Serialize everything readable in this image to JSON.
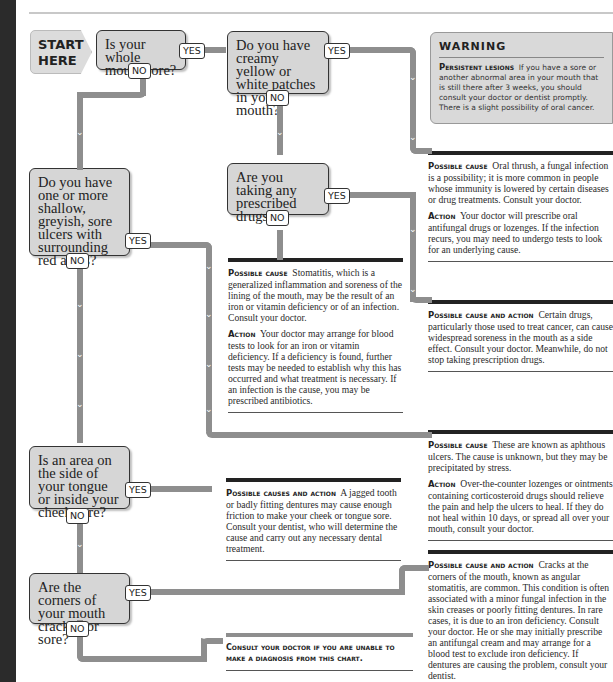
{
  "start": {
    "line1": "START",
    "line2": "HERE"
  },
  "labels": {
    "yes": "YES",
    "no": "NO"
  },
  "questions": [
    {
      "id": "q1",
      "text": "Is your whole mouth sore?"
    },
    {
      "id": "q2",
      "text": "Do you have creamy yellow or white patches in your mouth?"
    },
    {
      "id": "q3",
      "text": "Are you taking any prescribed drugs?"
    },
    {
      "id": "q4",
      "text": "Do you have one or more shallow, greyish, sore ulcers with surrounding red areas?"
    },
    {
      "id": "q5",
      "text": "Is an area on the side of your tongue or inside your cheek sore?"
    },
    {
      "id": "q6",
      "text": "Are the corners of your mouth cracked or sore?"
    }
  ],
  "warning": {
    "title": "WARNING",
    "label": "Persistent lesions",
    "body": "If you have a sore or another abnormal area in your mouth that is still there after 3 weeks, you should consult your doctor or dentist promptly. There is a slight possibility of oral cancer."
  },
  "answers": {
    "thrush": {
      "cause_label": "Possible cause",
      "cause": "Oral thrush, a fungal infection is a possibility; it is more common in people whose immunity is lowered by certain diseases or drug treatments. Consult your doctor.",
      "action_label": "Action",
      "action": "Your doctor will prescribe oral antifungal drugs or lozenges. If the infection recurs, you may need to undergo tests to look for an underlying cause."
    },
    "drugs": {
      "label": "Possible cause and action",
      "text": "Certain drugs, particularly those used to treat cancer, can cause widespread soreness in the mouth as a side effect. Consult your doctor. Meanwhile, do not stop taking prescription drugs."
    },
    "stomatitis": {
      "cause_label": "Possible cause",
      "cause": "Stomatitis, which is a generalized inflammation and soreness of the lining of the mouth, may be the result of an iron or vitamin deficiency or of an infection. Consult your doctor.",
      "action_label": "Action",
      "action": "Your doctor may arrange for blood tests to look for an iron or vitamin deficiency. If a deficiency is found, further tests may be needed to establish why this has occurred and what treatment is necessary. If an infection is the cause, you may be prescribed antibiotics."
    },
    "aphthous": {
      "cause_label": "Possible cause",
      "cause": "These are known as aphthous ulcers. The cause is unknown, but they may be precipitated by stress.",
      "action_label": "Action",
      "action": "Over-the-counter lozenges or ointments containing corticosteroid drugs should relieve the pain and help the ulcers to heal. If they do not heal within 10 days, or spread all over your mouth, consult your doctor."
    },
    "dental": {
      "label": "Possible causes and action",
      "text": "A jagged tooth or badly fitting dentures may cause enough friction to make your cheek or tongue sore. Consult your dentist, who will determine the cause and carry out any necessary dental treatment."
    },
    "angular": {
      "label": "Possible cause and action",
      "text": "Cracks at the corners of the mouth, known as angular stomatitis, are common. This condition is often associated with a minor fungal infection in the skin creases or poorly fitting dentures. In rare cases, it is due to an iron deficiency. Consult your doctor. He or she may initially prescribe an antifungal cream and may arrange for a blood test to exclude iron deficiency. If dentures are causing the problem, consult your dentist."
    },
    "consult": {
      "text": "Consult your doctor if you are unable to make a diagnosis from this chart."
    }
  },
  "colors": {
    "path": "#8e8e8e",
    "question_fill": "#d6d6d6",
    "warning_fill": "#d9d9d9",
    "band": "#2b2b2b"
  }
}
